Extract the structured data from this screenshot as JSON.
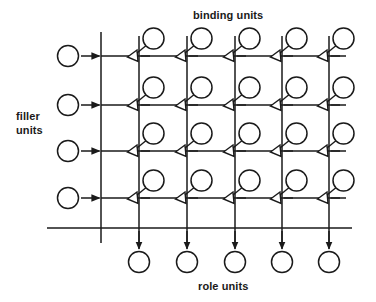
{
  "figure": {
    "type": "diagram",
    "name": "tensor-product-binding-network",
    "background_color": "#ffffff",
    "line_color": "#1a1a1a",
    "labels": {
      "binding_units": "binding units",
      "role_units": "role units",
      "filler_units": "filler\nunits"
    },
    "counts": {
      "filler_units": 4,
      "role_units": 5,
      "binding_rows": 4,
      "binding_cols": 5,
      "binding_units": 20
    },
    "geometry": {
      "circle_radius": 10.5,
      "filler_circle_x": 68,
      "row_y": [
        56,
        105,
        151,
        198
      ],
      "bus_x": 101,
      "col_x": [
        139,
        187,
        235,
        282,
        329
      ],
      "row_line_x_start": 101,
      "row_line_x_end": 346,
      "bottom_line_y": 228,
      "bottom_line_x_start": 47,
      "bottom_line_x_end": 352,
      "role_circle_y": 262,
      "bus_top_y": 32,
      "bus_bottom_y": 243,
      "col_top_y": 36
    },
    "connection_styles": {
      "filler_to_bus": "solid-arrowhead-right",
      "junction_to_binding": "open-triangle-arrowhead",
      "column_to_role": "solid-arrowhead-down"
    }
  }
}
